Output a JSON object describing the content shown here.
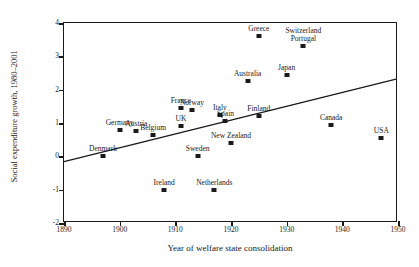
{
  "chart_data": {
    "type": "scatter",
    "title": "",
    "xlabel": "Year of welfare state consolidation",
    "ylabel": "Social expenditure growth, 1980–2001",
    "xlim": [
      1890,
      1950
    ],
    "ylim": [
      -2,
      4
    ],
    "xticks": [
      1890,
      1900,
      1910,
      1920,
      1930,
      1940,
      1950
    ],
    "yticks": [
      -2,
      -1,
      0,
      1,
      2,
      3,
      4
    ],
    "grid": false,
    "legend": null,
    "points": [
      {
        "label": "Denmark",
        "x": 1897,
        "y": 0.0
      },
      {
        "label": "Germany",
        "x": 1900,
        "y": 0.8
      },
      {
        "label": "Austria",
        "x": 1903,
        "y": 0.75
      },
      {
        "label": "Belgium",
        "x": 1906,
        "y": 0.65
      },
      {
        "label": "Ireland",
        "x": 1908,
        "y": -1.0
      },
      {
        "label": "France",
        "x": 1911,
        "y": 1.45
      },
      {
        "label": "Norway",
        "x": 1913,
        "y": 1.4
      },
      {
        "label": "UK",
        "x": 1911,
        "y": 0.9
      },
      {
        "label": "Sweden",
        "x": 1914,
        "y": 0.0
      },
      {
        "label": "Netherlands",
        "x": 1917,
        "y": -1.0
      },
      {
        "label": "New Zealand",
        "x": 1920,
        "y": 0.4
      },
      {
        "label": "Italy",
        "x": 1918,
        "y": 1.25
      },
      {
        "label": "Spain",
        "x": 1919,
        "y": 1.05
      },
      {
        "label": "Greece",
        "x": 1925,
        "y": 3.6
      },
      {
        "label": "Australia",
        "x": 1923,
        "y": 2.25
      },
      {
        "label": "Japan",
        "x": 1930,
        "y": 2.45
      },
      {
        "label": "Finland",
        "x": 1925,
        "y": 1.2
      },
      {
        "label": "Portugal",
        "x": 1933,
        "y": 3.3
      },
      {
        "label": "Switzerland",
        "x": 1933,
        "y": 3.3
      },
      {
        "label": "Canada",
        "x": 1938,
        "y": 0.95
      },
      {
        "label": "USA",
        "x": 1947,
        "y": 0.55
      }
    ],
    "trendline": {
      "x0": 1890,
      "y0": -0.2,
      "x1": 1950,
      "y1": 2.3
    }
  }
}
